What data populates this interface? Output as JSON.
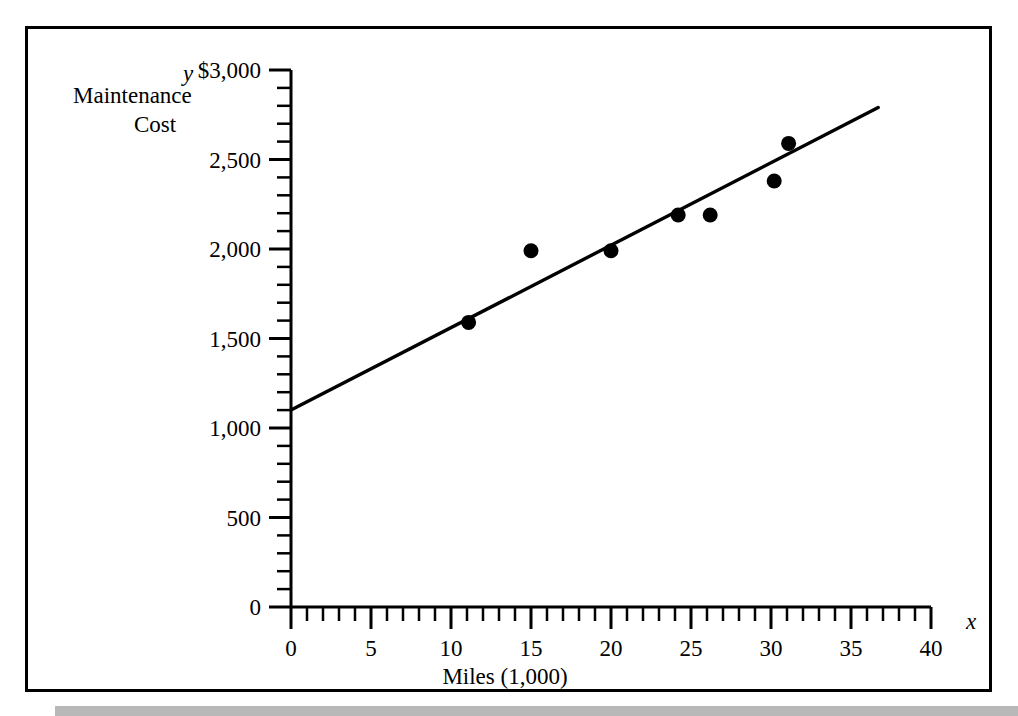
{
  "chart_data": {
    "type": "scatter",
    "title": "",
    "xlabel": "Miles (1,000)",
    "ylabel_lines": [
      "Maintenance",
      "Cost"
    ],
    "x_axis_symbol": "x",
    "y_axis_symbol": "y",
    "xlim": [
      0,
      40
    ],
    "ylim": [
      0,
      3000
    ],
    "x_major_step": 5,
    "x_minor_step": 1,
    "y_major_step": 500,
    "y_minor_step": 100,
    "grid": false,
    "legend": null,
    "x_tick_labels": [
      "0",
      "5",
      "10",
      "15",
      "20",
      "25",
      "30",
      "35",
      "40"
    ],
    "x_tick_values": [
      0,
      5,
      10,
      15,
      20,
      25,
      30,
      35,
      40
    ],
    "y_tick_labels": [
      "0",
      "500",
      "1,000",
      "1,500",
      "2,000",
      "2,500",
      "$3,000"
    ],
    "y_tick_values": [
      0,
      500,
      1000,
      1500,
      2000,
      2500,
      3000
    ],
    "points": [
      {
        "x": 11.1,
        "y": 1590
      },
      {
        "x": 15.0,
        "y": 1990
      },
      {
        "x": 20.0,
        "y": 1990
      },
      {
        "x": 24.2,
        "y": 2190
      },
      {
        "x": 26.2,
        "y": 2190
      },
      {
        "x": 30.2,
        "y": 2380
      },
      {
        "x": 31.1,
        "y": 2590
      }
    ],
    "trendline": {
      "name": "regression line",
      "x_start": 0,
      "y_start": 1100,
      "x_end": 36.7,
      "y_end": 2790
    },
    "series": [
      {
        "name": "Maintenance Cost vs Miles",
        "x": [
          11.1,
          15.0,
          20.0,
          24.2,
          26.2,
          30.2,
          31.1
        ],
        "values": [
          1590,
          1990,
          1990,
          2190,
          2190,
          2380,
          2590
        ]
      }
    ]
  }
}
